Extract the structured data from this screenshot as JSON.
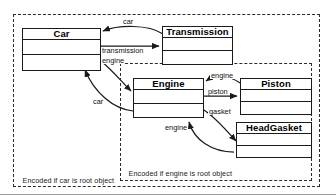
{
  "diagram": {
    "classes": [
      {
        "id": "car",
        "name": "Car",
        "compartments": 3
      },
      {
        "id": "transmission",
        "name": "Transmission",
        "compartments": 3
      },
      {
        "id": "engine",
        "name": "Engine",
        "compartments": 3
      },
      {
        "id": "piston",
        "name": "Piston",
        "compartments": 3
      },
      {
        "id": "headgasket",
        "name": "HeadGasket",
        "compartments": 3
      }
    ],
    "edges": [
      {
        "id": "e1",
        "label": "car",
        "from": "Transmission",
        "to": "Car"
      },
      {
        "id": "e2",
        "label": "transmission",
        "from": "Car",
        "to": "Transmission"
      },
      {
        "id": "e3",
        "label": "engine",
        "from": "Car",
        "to": "Engine"
      },
      {
        "id": "e4",
        "label": "car",
        "from": "Engine",
        "to": "Car"
      },
      {
        "id": "e5",
        "label": "engine",
        "from": "Piston",
        "to": "Engine"
      },
      {
        "id": "e6",
        "label": "piston",
        "from": "Engine",
        "to": "Piston"
      },
      {
        "id": "e7",
        "label": "gasket",
        "from": "Engine",
        "to": "HeadGasket"
      },
      {
        "id": "e8",
        "label": "engine",
        "from": "HeadGasket",
        "to": "Engine"
      }
    ],
    "scopes": [
      {
        "id": "car-scope",
        "caption": "Encoded if car is root object"
      },
      {
        "id": "engine-scope",
        "caption": "Encoded if engine is root object"
      }
    ],
    "colors": {
      "stroke": "#1a1a1a",
      "dashed": "#2b2b2b",
      "background": "#ffffff",
      "text": "#111111"
    }
  }
}
